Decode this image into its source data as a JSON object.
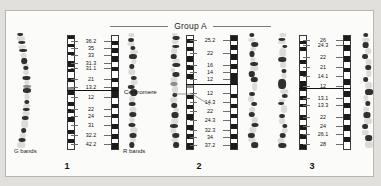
{
  "header": {
    "group_title": "Group A"
  },
  "annotations": {
    "centromere_label": "Centromere",
    "g_bands_label": "G bands",
    "r_bands_label": "R bands"
  },
  "colors": {
    "page_background": "#e2e0dd",
    "plate_background": "#fbfbfa",
    "plate_border": "#b8b6b2",
    "band_dark": "#1b1b1b",
    "band_light": "#ffffff",
    "band_gray": "#8d8d8d",
    "rule": "#7d7b78",
    "text": "#111111"
  },
  "chart_data": {
    "type": "diagram",
    "title": "Group A",
    "chromosomes": [
      {
        "number": "1",
        "centromere_position_pct": 48,
        "p_arm_labels": [
          "36.2",
          "35",
          "33",
          "31.3",
          "31.1",
          "21",
          "13.2"
        ],
        "q_arm_labels": [
          "12",
          "22",
          "24",
          "31",
          "32.2",
          "42.2"
        ],
        "label_positions_pct": [
          5,
          11,
          17,
          24,
          28.5,
          38.5,
          45,
          54,
          64,
          70,
          78,
          87,
          95
        ],
        "g_ideogram_bands": [
          {
            "top": 0,
            "height": 3,
            "tone": "dark"
          },
          {
            "top": 3,
            "height": 4,
            "tone": "light"
          },
          {
            "top": 7,
            "height": 3,
            "tone": "dark"
          },
          {
            "top": 10,
            "height": 4,
            "tone": "light"
          },
          {
            "top": 14,
            "height": 3,
            "tone": "dark"
          },
          {
            "top": 17,
            "height": 5,
            "tone": "light"
          },
          {
            "top": 22,
            "height": 5,
            "tone": "dark"
          },
          {
            "top": 27,
            "height": 2,
            "tone": "light"
          },
          {
            "top": 29,
            "height": 3,
            "tone": "dark"
          },
          {
            "top": 32,
            "height": 5,
            "tone": "light"
          },
          {
            "top": 37,
            "height": 4,
            "tone": "dark"
          },
          {
            "top": 41,
            "height": 4,
            "tone": "light"
          },
          {
            "top": 45,
            "height": 3,
            "tone": "gray"
          },
          {
            "top": 48,
            "height": 4,
            "tone": "dark"
          },
          {
            "top": 52,
            "height": 6,
            "tone": "light"
          },
          {
            "top": 58,
            "height": 4,
            "tone": "dark"
          },
          {
            "top": 62,
            "height": 3,
            "tone": "light"
          },
          {
            "top": 65,
            "height": 3,
            "tone": "dark"
          },
          {
            "top": 68,
            "height": 4,
            "tone": "light"
          },
          {
            "top": 72,
            "height": 4,
            "tone": "dark"
          },
          {
            "top": 76,
            "height": 7,
            "tone": "light"
          },
          {
            "top": 83,
            "height": 4,
            "tone": "dark"
          },
          {
            "top": 87,
            "height": 4,
            "tone": "light"
          },
          {
            "top": 91,
            "height": 4,
            "tone": "dark"
          },
          {
            "top": 95,
            "height": 5,
            "tone": "light"
          }
        ],
        "r_ideogram_bands": [
          {
            "top": 0,
            "height": 4,
            "tone": "light"
          },
          {
            "top": 4,
            "height": 4,
            "tone": "dark"
          },
          {
            "top": 8,
            "height": 3,
            "tone": "light"
          },
          {
            "top": 11,
            "height": 4,
            "tone": "dark"
          },
          {
            "top": 15,
            "height": 3,
            "tone": "light"
          },
          {
            "top": 18,
            "height": 5,
            "tone": "dark"
          },
          {
            "top": 23,
            "height": 4,
            "tone": "light"
          },
          {
            "top": 27,
            "height": 4,
            "tone": "dark"
          },
          {
            "top": 31,
            "height": 6,
            "tone": "light"
          },
          {
            "top": 37,
            "height": 4,
            "tone": "dark"
          },
          {
            "top": 41,
            "height": 4,
            "tone": "light"
          },
          {
            "top": 45,
            "height": 4,
            "tone": "dark"
          },
          {
            "top": 49,
            "height": 6,
            "tone": "dark"
          },
          {
            "top": 55,
            "height": 5,
            "tone": "light"
          },
          {
            "top": 60,
            "height": 4,
            "tone": "dark"
          },
          {
            "top": 64,
            "height": 5,
            "tone": "light"
          },
          {
            "top": 69,
            "height": 4,
            "tone": "dark"
          },
          {
            "top": 73,
            "height": 5,
            "tone": "light"
          },
          {
            "top": 78,
            "height": 4,
            "tone": "dark"
          },
          {
            "top": 82,
            "height": 5,
            "tone": "light"
          },
          {
            "top": 87,
            "height": 4,
            "tone": "dark"
          },
          {
            "top": 91,
            "height": 4,
            "tone": "light"
          },
          {
            "top": 95,
            "height": 5,
            "tone": "dark"
          }
        ]
      },
      {
        "number": "2",
        "centromere_position_pct": 43,
        "p_arm_labels": [
          "25.2",
          "22",
          "16",
          "14",
          "12"
        ],
        "q_arm_labels": [
          "12",
          "14.3",
          "22",
          "24.3",
          "32.3",
          "34",
          "37.2"
        ],
        "label_positions_pct": [
          4,
          16,
          26,
          32,
          38,
          50,
          58,
          66,
          74,
          83,
          89,
          96
        ],
        "g_ideogram_bands": [
          {
            "top": 0,
            "height": 3,
            "tone": "light"
          },
          {
            "top": 3,
            "height": 3,
            "tone": "dark"
          },
          {
            "top": 6,
            "height": 4,
            "tone": "light"
          },
          {
            "top": 10,
            "height": 3,
            "tone": "dark"
          },
          {
            "top": 13,
            "height": 5,
            "tone": "light"
          },
          {
            "top": 18,
            "height": 5,
            "tone": "dark"
          },
          {
            "top": 23,
            "height": 3,
            "tone": "light"
          },
          {
            "top": 26,
            "height": 4,
            "tone": "dark"
          },
          {
            "top": 30,
            "height": 4,
            "tone": "light"
          },
          {
            "top": 34,
            "height": 4,
            "tone": "dark"
          },
          {
            "top": 38,
            "height": 5,
            "tone": "light"
          },
          {
            "top": 43,
            "height": 3,
            "tone": "gray"
          },
          {
            "top": 46,
            "height": 6,
            "tone": "light"
          },
          {
            "top": 52,
            "height": 4,
            "tone": "dark"
          },
          {
            "top": 56,
            "height": 5,
            "tone": "light"
          },
          {
            "top": 61,
            "height": 4,
            "tone": "dark"
          },
          {
            "top": 65,
            "height": 4,
            "tone": "light"
          },
          {
            "top": 69,
            "height": 5,
            "tone": "dark"
          },
          {
            "top": 74,
            "height": 5,
            "tone": "light"
          },
          {
            "top": 79,
            "height": 4,
            "tone": "dark"
          },
          {
            "top": 83,
            "height": 4,
            "tone": "light"
          },
          {
            "top": 87,
            "height": 4,
            "tone": "dark"
          },
          {
            "top": 91,
            "height": 4,
            "tone": "light"
          },
          {
            "top": 95,
            "height": 5,
            "tone": "dark"
          }
        ],
        "r_ideogram_bands": [
          {
            "top": 0,
            "height": 4,
            "tone": "dark"
          },
          {
            "top": 4,
            "height": 4,
            "tone": "light"
          },
          {
            "top": 8,
            "height": 4,
            "tone": "dark"
          },
          {
            "top": 12,
            "height": 4,
            "tone": "light"
          },
          {
            "top": 16,
            "height": 5,
            "tone": "dark"
          },
          {
            "top": 21,
            "height": 4,
            "tone": "light"
          },
          {
            "top": 25,
            "height": 4,
            "tone": "dark"
          },
          {
            "top": 29,
            "height": 4,
            "tone": "light"
          },
          {
            "top": 33,
            "height": 5,
            "tone": "dark"
          },
          {
            "top": 38,
            "height": 5,
            "tone": "dark"
          },
          {
            "top": 43,
            "height": 8,
            "tone": "light"
          },
          {
            "top": 51,
            "height": 4,
            "tone": "dark"
          },
          {
            "top": 55,
            "height": 5,
            "tone": "light"
          },
          {
            "top": 60,
            "height": 4,
            "tone": "dark"
          },
          {
            "top": 64,
            "height": 5,
            "tone": "light"
          },
          {
            "top": 69,
            "height": 4,
            "tone": "dark"
          },
          {
            "top": 73,
            "height": 5,
            "tone": "light"
          },
          {
            "top": 78,
            "height": 4,
            "tone": "dark"
          },
          {
            "top": 82,
            "height": 5,
            "tone": "light"
          },
          {
            "top": 87,
            "height": 4,
            "tone": "dark"
          },
          {
            "top": 91,
            "height": 4,
            "tone": "light"
          },
          {
            "top": 95,
            "height": 5,
            "tone": "dark"
          }
        ]
      },
      {
        "number": "3",
        "centromere_position_pct": 46,
        "p_arm_labels": [
          "26",
          "24.3",
          "22",
          "21",
          "14.1",
          "12"
        ],
        "q_arm_labels": [
          "13.1",
          "13.3",
          "22",
          "24",
          "26.1",
          "28"
        ],
        "label_positions_pct": [
          4,
          9,
          19,
          28,
          36,
          44,
          55,
          61,
          71,
          79,
          86,
          95
        ],
        "g_ideogram_bands": [
          {
            "top": 0,
            "height": 4,
            "tone": "light"
          },
          {
            "top": 4,
            "height": 3,
            "tone": "dark"
          },
          {
            "top": 7,
            "height": 3,
            "tone": "light"
          },
          {
            "top": 10,
            "height": 3,
            "tone": "dark"
          },
          {
            "top": 13,
            "height": 8,
            "tone": "light"
          },
          {
            "top": 21,
            "height": 4,
            "tone": "dark"
          },
          {
            "top": 25,
            "height": 6,
            "tone": "light"
          },
          {
            "top": 31,
            "height": 4,
            "tone": "dark"
          },
          {
            "top": 35,
            "height": 5,
            "tone": "light"
          },
          {
            "top": 40,
            "height": 9,
            "tone": "dark"
          },
          {
            "top": 49,
            "height": 4,
            "tone": "light"
          },
          {
            "top": 53,
            "height": 4,
            "tone": "dark"
          },
          {
            "top": 57,
            "height": 3,
            "tone": "light"
          },
          {
            "top": 60,
            "height": 3,
            "tone": "dark"
          },
          {
            "top": 63,
            "height": 7,
            "tone": "light"
          },
          {
            "top": 70,
            "height": 4,
            "tone": "dark"
          },
          {
            "top": 74,
            "height": 5,
            "tone": "light"
          },
          {
            "top": 79,
            "height": 4,
            "tone": "dark"
          },
          {
            "top": 83,
            "height": 4,
            "tone": "light"
          },
          {
            "top": 87,
            "height": 4,
            "tone": "dark"
          },
          {
            "top": 91,
            "height": 5,
            "tone": "light"
          },
          {
            "top": 96,
            "height": 4,
            "tone": "dark"
          }
        ],
        "r_ideogram_bands": [
          {
            "top": 0,
            "height": 4,
            "tone": "dark"
          },
          {
            "top": 4,
            "height": 4,
            "tone": "light"
          },
          {
            "top": 8,
            "height": 5,
            "tone": "dark"
          },
          {
            "top": 13,
            "height": 5,
            "tone": "light"
          },
          {
            "top": 18,
            "height": 5,
            "tone": "dark"
          },
          {
            "top": 23,
            "height": 5,
            "tone": "light"
          },
          {
            "top": 28,
            "height": 4,
            "tone": "dark"
          },
          {
            "top": 32,
            "height": 6,
            "tone": "light"
          },
          {
            "top": 38,
            "height": 5,
            "tone": "dark"
          },
          {
            "top": 43,
            "height": 6,
            "tone": "light"
          },
          {
            "top": 49,
            "height": 5,
            "tone": "dark"
          },
          {
            "top": 54,
            "height": 5,
            "tone": "light"
          },
          {
            "top": 59,
            "height": 5,
            "tone": "dark"
          },
          {
            "top": 64,
            "height": 5,
            "tone": "light"
          },
          {
            "top": 69,
            "height": 5,
            "tone": "dark"
          },
          {
            "top": 74,
            "height": 5,
            "tone": "light"
          },
          {
            "top": 79,
            "height": 5,
            "tone": "dark"
          },
          {
            "top": 84,
            "height": 5,
            "tone": "light"
          },
          {
            "top": 89,
            "height": 5,
            "tone": "dark"
          },
          {
            "top": 94,
            "height": 6,
            "tone": "light"
          }
        ]
      }
    ]
  }
}
